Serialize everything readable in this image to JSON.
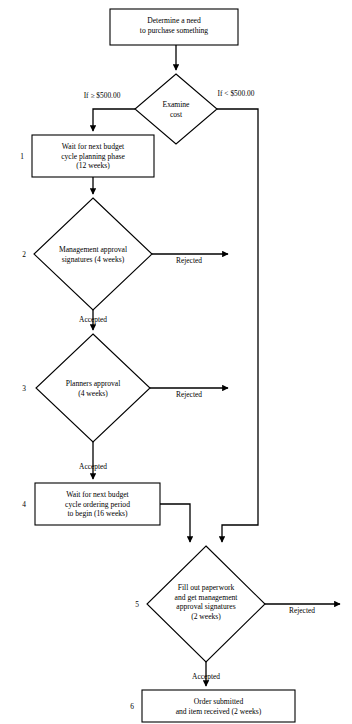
{
  "diagram": {
    "stroke_color": "#000000",
    "fill_color": "#ffffff",
    "nodes": [
      {
        "id": "determine-need",
        "shape": "process",
        "number": "",
        "text": "Determine a need\nto purchase something"
      },
      {
        "id": "examine-cost",
        "shape": "decision",
        "number": "",
        "text": "Examine\ncost"
      },
      {
        "id": "budget-planning-wait",
        "shape": "process",
        "number": "1",
        "text": "Wait for next budget\ncycle planning phase\n(12 weeks)"
      },
      {
        "id": "management-approval",
        "shape": "decision",
        "number": "2",
        "text": "Management approval\nsignatures (4 weeks)"
      },
      {
        "id": "planners-approval",
        "shape": "decision",
        "number": "3",
        "text": "Planners approval\n(4 weeks)"
      },
      {
        "id": "budget-ordering-wait",
        "shape": "process",
        "number": "4",
        "text": "Wait for next budget\ncycle ordering period\nto begin (16 weeks)"
      },
      {
        "id": "fill-paperwork",
        "shape": "decision",
        "number": "5",
        "text": "Fill out paperwork\nand get management\napproval signatures\n(2 weeks)"
      },
      {
        "id": "order-submitted",
        "shape": "process",
        "number": "6",
        "text": "Order submitted\nand item received (2 weeks)"
      }
    ],
    "edge_labels": {
      "cost_ge": "If ≥ $500.00",
      "cost_lt": "If < $500.00",
      "rejected_2": "Rejected",
      "accepted_2": "Accepted",
      "rejected_3": "Rejected",
      "accepted_3": "Accepted",
      "rejected_5": "Rejected",
      "accepted_5": "Accepted"
    }
  }
}
